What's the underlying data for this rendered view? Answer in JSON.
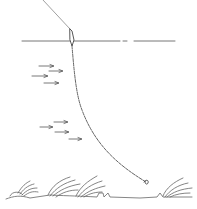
{
  "diagram": {
    "colors": {
      "background": "#ffffff",
      "ink": "#555555",
      "ink_light": "#888888"
    },
    "elements": {
      "rod_line": "line from above to float",
      "float": "float at water surface",
      "water_surface": "horizontal water line",
      "current_arrows_upper": 4,
      "current_arrows_lower": 4,
      "submerged_line": "curved line from float down to hook",
      "hook": "baited hook near bottom",
      "bottom": "river bed with weeds"
    }
  }
}
